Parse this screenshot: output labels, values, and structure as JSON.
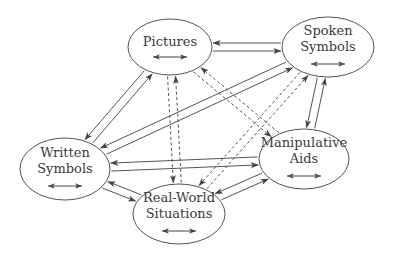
{
  "diagram": {
    "nodes": [
      {
        "id": "pictures",
        "lines": [
          "Pictures"
        ]
      },
      {
        "id": "spoken",
        "lines": [
          "Spoken",
          "Symbols"
        ]
      },
      {
        "id": "written",
        "lines": [
          "Written",
          "Symbols"
        ]
      },
      {
        "id": "manipulative",
        "lines": [
          "Manipulative",
          "Aids"
        ]
      },
      {
        "id": "realworld",
        "lines": [
          "Real-World",
          "Situations"
        ]
      }
    ],
    "edges": [
      {
        "from": "pictures",
        "to": "spoken",
        "style": "solid",
        "bidirectional_pair": true
      },
      {
        "from": "pictures",
        "to": "written",
        "style": "solid",
        "bidirectional_pair": true
      },
      {
        "from": "pictures",
        "to": "realworld",
        "style": "dashed",
        "bidirectional_pair": true
      },
      {
        "from": "pictures",
        "to": "manipulative",
        "style": "dashed",
        "bidirectional_pair": true
      },
      {
        "from": "spoken",
        "to": "written",
        "style": "solid",
        "bidirectional_pair": true
      },
      {
        "from": "spoken",
        "to": "manipulative",
        "style": "solid",
        "bidirectional_pair": true
      },
      {
        "from": "spoken",
        "to": "realworld",
        "style": "dashed",
        "bidirectional_pair": true
      },
      {
        "from": "written",
        "to": "manipulative",
        "style": "solid",
        "bidirectional_pair": true
      },
      {
        "from": "written",
        "to": "realworld",
        "style": "solid",
        "bidirectional_pair": true
      },
      {
        "from": "manipulative",
        "to": "realworld",
        "style": "solid",
        "bidirectional_pair": true
      }
    ],
    "self_loop_icon": "double-headed-arrow"
  }
}
